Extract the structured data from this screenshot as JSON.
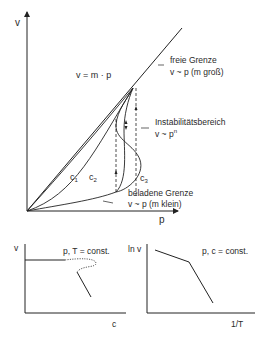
{
  "main_diagram": {
    "y_axis_label": "v",
    "x_axis_label": "p",
    "equation": "v = m · p",
    "free_limit": {
      "title": "freie Grenze",
      "relation": "v ~ p (m groß)"
    },
    "instability": {
      "title": "Instabilitätsbereich",
      "relation_base": "v ~ p",
      "relation_exp": "n"
    },
    "loaded_limit": {
      "title": "beladene Grenze",
      "relation": "v ~ p (m klein)"
    },
    "curves": [
      {
        "name": "c",
        "sub": "1"
      },
      {
        "name": "c",
        "sub": "2"
      },
      {
        "name": "c",
        "sub": "3"
      }
    ]
  },
  "bottom_left": {
    "y_axis_label": "v",
    "x_axis_label": "c",
    "condition": "p, T = const."
  },
  "bottom_right": {
    "y_axis_label": "ln v",
    "x_axis_label": "1/T",
    "condition": "p, c = const."
  }
}
